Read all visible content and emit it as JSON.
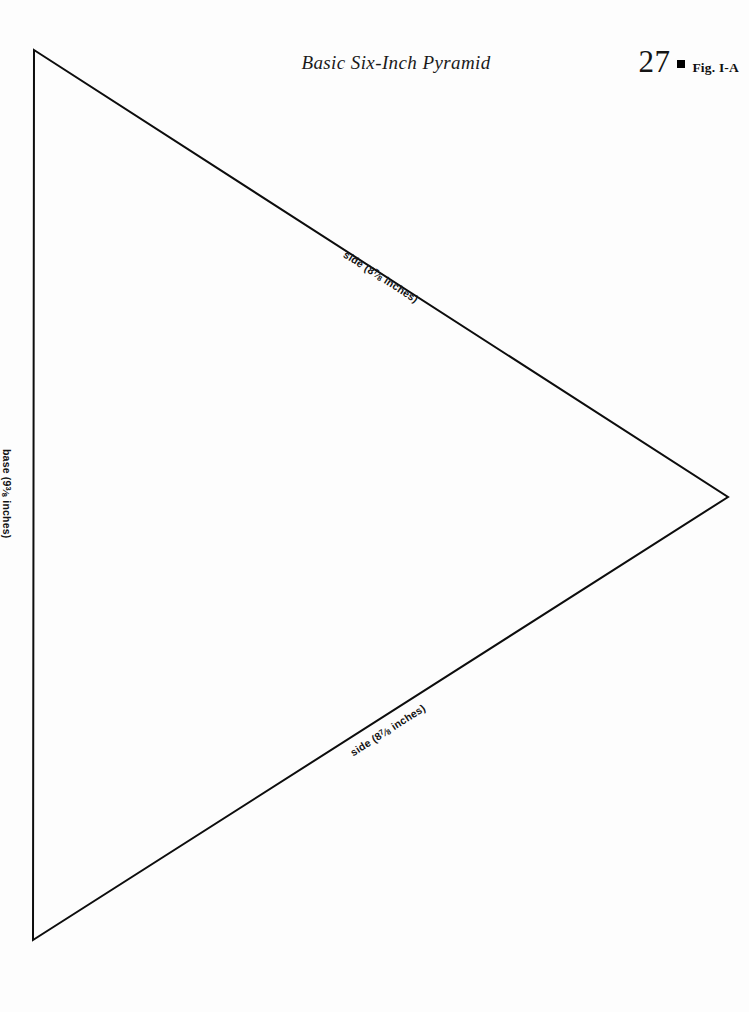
{
  "page": {
    "title": "Basic Six-Inch Pyramid",
    "page_number": "27",
    "figure_label": "Fig. I-A",
    "bullet_icon": "filled-square-icon",
    "background_color": "#fdfdfd",
    "ink_color": "#111111"
  },
  "figure": {
    "shape": "isosceles-triangle",
    "stroke_color": "#0d0d0d",
    "stroke_width": 2,
    "vertices": {
      "apex_top_left": [
        34,
        50
      ],
      "apex_right": [
        728,
        497
      ],
      "apex_bottom_left": [
        33,
        940
      ]
    },
    "labels": {
      "side_top": {
        "prefix": "side (8",
        "numerator": "7",
        "denominator": "8",
        "suffix": " inches)",
        "full_text": "side (8 7/8 inches)"
      },
      "side_bottom": {
        "prefix": "side (8",
        "numerator": "7",
        "denominator": "8",
        "suffix": " inches)",
        "full_text": "side (8 7/8 inches)"
      },
      "base": {
        "prefix": "base (9",
        "numerator": "3",
        "denominator": "8",
        "suffix": " inches)",
        "full_text": "base (9 3/8 inches)"
      }
    }
  }
}
